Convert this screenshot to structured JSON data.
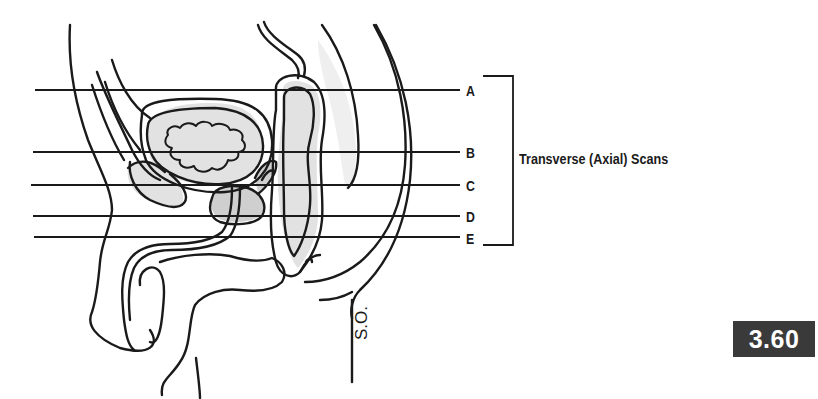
{
  "figure": {
    "number": "3.60",
    "artist_initials": "S.O.",
    "bracket_caption": "Transverse (Axial) Scans",
    "colors": {
      "line": "#1a1a1a",
      "organ_fill": "#e2e2e2",
      "organ_fill_dark": "#cfcfcf",
      "badge_bg": "#3a3a3a",
      "badge_text": "#ffffff",
      "background": "#ffffff"
    },
    "scan_lines": [
      {
        "label": "A",
        "y": 90,
        "x_start": 35,
        "x_end": 460
      },
      {
        "label": "B",
        "y": 152,
        "x_start": 33,
        "x_end": 460
      },
      {
        "label": "C",
        "y": 185,
        "x_start": 31,
        "x_end": 460
      },
      {
        "label": "D",
        "y": 216,
        "x_start": 33,
        "x_end": 460
      },
      {
        "label": "E",
        "y": 237,
        "x_start": 34,
        "x_end": 460
      }
    ],
    "bracket": {
      "x_left": 483,
      "x_right": 513,
      "y_top": 76,
      "y_bottom": 245
    }
  }
}
